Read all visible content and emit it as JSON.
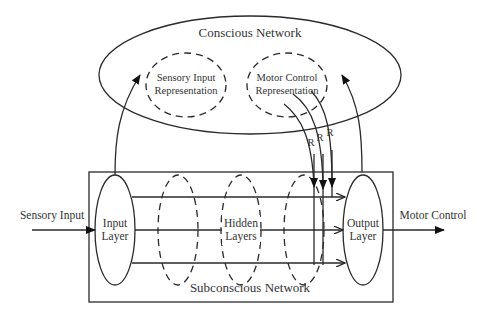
{
  "diagram": {
    "type": "neural-architecture",
    "conscious_network": {
      "label": "Conscious Network",
      "sensory_representation": {
        "line1": "Sensory Input",
        "line2": "Representation"
      },
      "motor_representation": {
        "line1": "Motor Control",
        "line2": "Representation"
      }
    },
    "subconscious_network": {
      "label": "Subconscious Network",
      "input_layer": {
        "line1": "Input",
        "line2": "Layer"
      },
      "hidden_layers": {
        "line1": "Hidden",
        "line2": "Layers"
      },
      "output_layer": {
        "line1": "Output",
        "line2": "Layer"
      }
    },
    "external": {
      "input_label": "Sensory Input",
      "output_label": "Motor Control"
    },
    "recurrent_labels": [
      "R",
      "R",
      "R"
    ],
    "colors": {
      "stroke": "#2a2a2a",
      "text": "#333333",
      "background": "#ffffff"
    }
  }
}
